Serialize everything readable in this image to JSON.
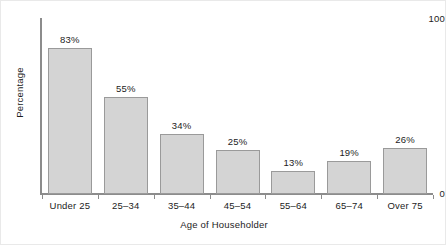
{
  "chart_data": {
    "type": "bar",
    "title": "",
    "xlabel": "Age of Householder",
    "ylabel": "Percentage",
    "categories": [
      "Under 25",
      "25–34",
      "35–44",
      "45–54",
      "55–64",
      "65–74",
      "Over 75"
    ],
    "values": [
      83,
      55,
      34,
      25,
      13,
      19,
      26
    ],
    "value_labels": [
      "83%",
      "55%",
      "34%",
      "25%",
      "13%",
      "19%",
      "26%"
    ],
    "ylim": [
      0,
      100
    ],
    "ytick_labels": [
      "100",
      "0"
    ],
    "ytick_values": [
      100,
      0
    ],
    "grid": false,
    "legend": null,
    "colors": {
      "bar_fill": "#d4d4d4",
      "bar_stroke": "#9a9a9a",
      "axis": "#8c8c8c",
      "text": "#1c1c1c",
      "background": "#ffffff",
      "frame": "#e9e9e9"
    }
  }
}
